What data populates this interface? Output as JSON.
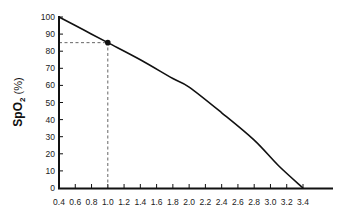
{
  "chart_data": {
    "type": "line",
    "title": "",
    "xlabel": "",
    "ylabel": "SpO2 (%)",
    "ylabel_main": "SpO",
    "ylabel_sub": "2",
    "ylabel_unit": " (%)",
    "xlim": [
      0.4,
      3.4
    ],
    "ylim": [
      0,
      100
    ],
    "x_ticks": [
      0.4,
      0.6,
      0.8,
      1.0,
      1.2,
      1.4,
      1.6,
      1.8,
      2.0,
      2.2,
      2.4,
      2.6,
      2.8,
      3.0,
      3.2,
      3.4
    ],
    "x_tick_labels": [
      "0.4",
      "0.6",
      "0.8",
      "1.0",
      "1.2",
      "1.4",
      "1.6",
      "1.8",
      "2.0",
      "2.2",
      "2.4",
      "2.6",
      "2.8",
      "3.0",
      "3.2",
      "3.4"
    ],
    "y_ticks": [
      0,
      10,
      20,
      30,
      40,
      50,
      60,
      70,
      80,
      90,
      100
    ],
    "y_tick_labels": [
      "0",
      "10",
      "20",
      "30",
      "40",
      "50",
      "60",
      "70",
      "80",
      "90",
      "100"
    ],
    "grid": false,
    "legend": null,
    "series": [
      {
        "name": "SpO2 curve",
        "x": [
          0.4,
          0.7,
          1.0,
          1.4,
          1.8,
          2.0,
          2.4,
          2.8,
          3.1,
          3.4
        ],
        "values": [
          100,
          92.5,
          85,
          75,
          64,
          59,
          44,
          28,
          13,
          0
        ],
        "color": "#111111"
      }
    ],
    "highlighted_point": {
      "x": 1.0,
      "y": 85
    },
    "reference_lines": [
      {
        "type": "vertical",
        "x": 1.0,
        "from_y": 0,
        "to_y": 85,
        "style": "dashed"
      },
      {
        "type": "horizontal",
        "y": 85,
        "from_x": 0.4,
        "to_x": 1.0,
        "style": "dashed"
      }
    ]
  }
}
